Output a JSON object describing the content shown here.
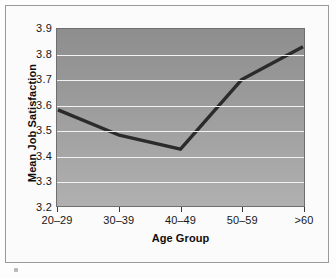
{
  "chart_data": {
    "type": "line",
    "title": "",
    "xlabel": "Age Group",
    "ylabel": "Mean Job Satisfaction",
    "categories": [
      "20–29",
      "30–39",
      "40–49",
      "50–59",
      ">60"
    ],
    "values": [
      3.58,
      3.48,
      3.425,
      3.7,
      3.83
    ],
    "series": [
      {
        "name": "Mean Job Satisfaction",
        "values": [
          3.58,
          3.48,
          3.425,
          3.7,
          3.83
        ]
      }
    ],
    "ylim": [
      3.2,
      3.9
    ],
    "y_ticks": [
      "3.9",
      "3.8",
      "3.7",
      "3.6",
      "3.5",
      "3.4",
      "3.3",
      "3.2"
    ],
    "y_tick_values": [
      3.9,
      3.8,
      3.7,
      3.6,
      3.5,
      3.4,
      3.3,
      3.2
    ],
    "grid": true,
    "legend": "none",
    "colors": {
      "line": "#2b2b2b",
      "plot_background_top": "#8e8e8e",
      "plot_background_bottom": "#b0b0b0",
      "gridline": "#f2f2f2",
      "axis": "#3a3a3a",
      "text": "#161616",
      "frame": "#9a9a9a"
    }
  }
}
